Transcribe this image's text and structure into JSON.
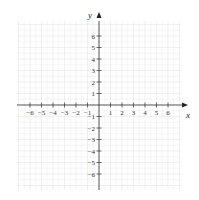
{
  "chart_data": {
    "type": "coordinate-grid",
    "title": "",
    "xlabel": "x",
    "ylabel": "y",
    "xlim": [
      -7,
      7
    ],
    "ylim": [
      -7,
      7
    ],
    "grid": true,
    "x_ticks": [
      -6,
      -5,
      -4,
      -3,
      -2,
      -1,
      1,
      2,
      3,
      4,
      5,
      6
    ],
    "y_ticks": [
      6,
      5,
      4,
      3,
      2,
      1,
      -1,
      -2,
      -3,
      -4,
      -5,
      -6
    ],
    "x_tick_labels": [
      "−6",
      "−5",
      "−4",
      "−3",
      "−2",
      "−1",
      "1",
      "2",
      "3",
      "4",
      "5",
      "6"
    ],
    "y_tick_labels": [
      "6",
      "5",
      "4",
      "3",
      "2",
      "1",
      "−1",
      "−2",
      "−3",
      "−4",
      "−5",
      "−6"
    ],
    "series": []
  },
  "colors": {
    "grid": "#e6e6e6",
    "axis": "#333333"
  }
}
